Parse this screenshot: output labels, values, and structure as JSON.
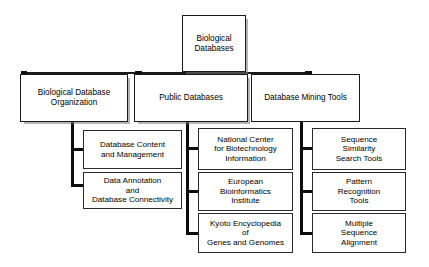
{
  "diagram": {
    "colors": {
      "box_border": "#1a1a1a",
      "box_fill": "#ffffff",
      "connector": "#111111",
      "shadow": "rgba(120,120,120,0.55)",
      "background": "#ffffff"
    },
    "root": {
      "label": "Biological\nDatabases"
    },
    "branches": [
      {
        "label": "Biological Database\nOrganization",
        "children": [
          {
            "label": "Database Content\nand Management"
          },
          {
            "label": "Data Annotation\nand\nDatabase Connectivity"
          }
        ]
      },
      {
        "label": "Public Databases",
        "children": [
          {
            "label": "National Center\nfor Biotechnology\nInformation"
          },
          {
            "label": "European\nBioinformatics\nInstitute"
          },
          {
            "label": "Kyoto Encyclopedia\nof\nGenes and Genomes"
          }
        ]
      },
      {
        "label": "Database Mining Tools",
        "children": [
          {
            "label": "Sequence\nSimilarity\nSearch Tools"
          },
          {
            "label": "Pattern\nRecognition\nTools"
          },
          {
            "label": "Multiple\nSequence\nAlignment"
          }
        ]
      }
    ]
  }
}
